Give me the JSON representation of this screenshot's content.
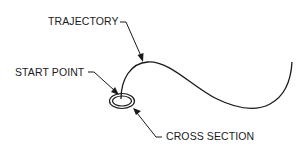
{
  "diagram": {
    "labels": {
      "trajectory": "TRAJECTORY",
      "start_point": "START POINT",
      "cross_section": "CROSS SECTION"
    },
    "colors": {
      "ink": "#1a1a1a",
      "background": "#ffffff"
    },
    "elements": [
      {
        "id": "trajectory-curve",
        "type": "spline",
        "description": "S-shaped open curve starting at start point, rising to a crest, dipping and rising at the right end"
      },
      {
        "id": "cross-section",
        "type": "double-ellipse",
        "description": "Small double-ring ellipse at the start of the trajectory"
      },
      {
        "id": "trajectory-leader",
        "type": "leader-arrow",
        "points_to": "trajectory crest"
      },
      {
        "id": "start-point-leader",
        "type": "leader-arrow",
        "points_to": "start point inside cross section"
      },
      {
        "id": "cross-section-leader",
        "type": "leader-arrow",
        "points_to": "cross section ellipse"
      }
    ]
  }
}
